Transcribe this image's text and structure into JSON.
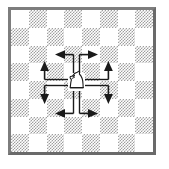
{
  "diagram": {
    "piece": "knight",
    "piece_color": "white",
    "piece_square": "e5",
    "board": {
      "files": 8,
      "ranks": 8,
      "top_left_square_color": "light",
      "light_color": "#ffffff",
      "dark_color": "#9f9f9f",
      "dark_fill_style": "halftone-checker",
      "border_color": "#7d7d7d",
      "border_width_px": 3
    },
    "arrow_color": "#1a1a1a",
    "arrow_groups": [
      {
        "name": "up-group",
        "shaft_direction": "up",
        "shaft_length_squares": 2,
        "heads": [
          "left",
          "right"
        ],
        "targets": [
          "d7",
          "f7"
        ]
      },
      {
        "name": "down-group",
        "shaft_direction": "down",
        "shaft_length_squares": 2,
        "heads": [
          "left",
          "right"
        ],
        "targets": [
          "d3",
          "f3"
        ]
      },
      {
        "name": "left-group",
        "shaft_direction": "left",
        "shaft_length_squares": 2,
        "heads": [
          "up",
          "down"
        ],
        "targets": [
          "c6",
          "c4"
        ]
      },
      {
        "name": "right-group",
        "shaft_direction": "right",
        "shaft_length_squares": 2,
        "heads": [
          "up",
          "down"
        ],
        "targets": [
          "g6",
          "g4"
        ]
      }
    ],
    "total_moves": 8
  }
}
